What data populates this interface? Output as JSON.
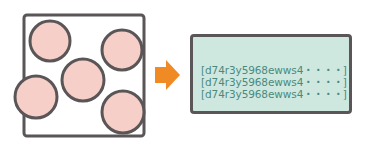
{
  "diagram": {
    "colors": {
      "outline": "#5a5556",
      "particle_fill": "#f7cfc9",
      "arrow": "#f08a24",
      "text_box_fill": "#cfe8df",
      "text_color": "#4a8a7e"
    },
    "source": {
      "label": "container-with-particles",
      "particle_count": 5
    },
    "arrow_icon": "right-arrow-icon",
    "output": {
      "lines": [
        "[d74r3y5968ewws4・・・・]",
        "[d74r3y5968ewws4・・・・]",
        "[d74r3y5968ewws4・・・・]"
      ]
    }
  }
}
